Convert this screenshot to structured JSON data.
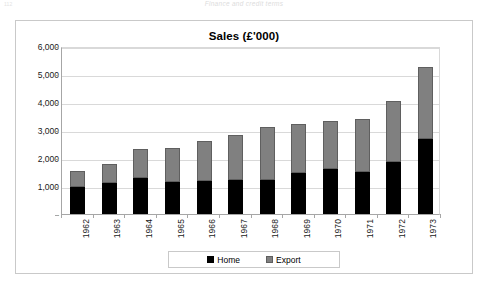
{
  "page_header": {
    "folio": "112",
    "running_head": "Finance and credit terms"
  },
  "chart": {
    "title": "Sales (£'000)",
    "legend": {
      "home_label": "Home",
      "export_label": "Export"
    }
  },
  "chart_data": {
    "type": "bar",
    "subtype": "stacked",
    "title": "Sales (£'000)",
    "xlabel": "",
    "ylabel": "",
    "ylim": [
      0,
      6000
    ],
    "ytick_labels": [
      "6,000",
      "5,000",
      "4,000",
      "3,000",
      "2,000",
      "1,000",
      "-"
    ],
    "ytick_values": [
      6000,
      5000,
      4000,
      3000,
      2000,
      1000,
      0
    ],
    "grid": true,
    "legend_position": "bottom",
    "categories": [
      "1962",
      "1963",
      "1964",
      "1965",
      "1966",
      "1967",
      "1968",
      "1969",
      "1970",
      "1971",
      "1972",
      "1973"
    ],
    "series": [
      {
        "name": "Home",
        "color": "#000000",
        "values": [
          950,
          1100,
          1280,
          1130,
          1170,
          1200,
          1200,
          1480,
          1620,
          1500,
          1870,
          2670
        ]
      },
      {
        "name": "Export",
        "color": "#808080",
        "values": [
          600,
          700,
          1050,
          1240,
          1450,
          1630,
          1900,
          1720,
          1700,
          1900,
          2150,
          2580
        ]
      }
    ],
    "totals": [
      1550,
      1800,
      2330,
      2370,
      2620,
      2830,
      3100,
      3200,
      3320,
      3400,
      4020,
      5250
    ]
  }
}
